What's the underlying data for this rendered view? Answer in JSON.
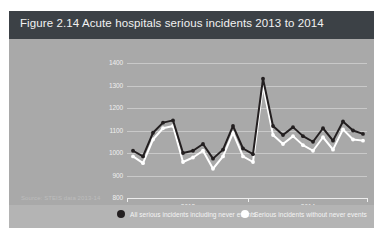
{
  "figure": {
    "title": "Figure 2.14  Acute hospitals serious incidents 2013 to 2014",
    "source_note": "Source: STEIS data 2013-14"
  },
  "colors": {
    "panel_background": "#a9a9a9",
    "header_background": "#3c4146",
    "legend_background": "#b4b4b4",
    "series_dark": "#231f20",
    "series_light": "#ffffff",
    "gridline": "#cfcfcf",
    "axis": "#ededed",
    "title_text": "#f2f2f2",
    "label_text": "#efefef",
    "source_text": "#bdbdbd"
  },
  "legend": {
    "entries": [
      {
        "label": "All serious incidents including never events",
        "marker": "filled-circle",
        "color": "#231f20"
      },
      {
        "label": "Serious incidents without never events",
        "marker": "open-circle",
        "color": "#ffffff"
      }
    ]
  },
  "chart_data": {
    "type": "line",
    "title": "Figure 2.14  Acute hospitals serious incidents 2013 to 2014",
    "xlabel": "",
    "ylabel": "",
    "ylim": [
      800,
      1400
    ],
    "yticks": [
      1400,
      1300,
      1200,
      1100,
      1000,
      900,
      800
    ],
    "ytick_labels": [
      "1400",
      "1300",
      "1200",
      "1100",
      "1000",
      "900",
      "800"
    ],
    "grid": true,
    "legend_position": "bottom",
    "x_axis_groups": [
      {
        "label": "2013",
        "start_index": 0,
        "end_index": 11
      },
      {
        "label": "2014",
        "start_index": 12,
        "end_index": 23
      }
    ],
    "x_tick_labels": [
      "2013",
      "2014"
    ],
    "x": [
      1,
      2,
      3,
      4,
      5,
      6,
      7,
      8,
      9,
      10,
      11,
      12,
      13,
      14,
      15,
      16,
      17,
      18,
      19,
      20,
      21,
      22,
      23,
      24
    ],
    "series": [
      {
        "name": "All serious incidents including never events",
        "color": "#231f20",
        "marker": "filled-circle",
        "values": [
          1010,
          985,
          1090,
          1135,
          1145,
          1000,
          1010,
          1040,
          975,
          1015,
          1120,
          1020,
          995,
          1330,
          1120,
          1080,
          1115,
          1075,
          1050,
          1110,
          1055,
          1140,
          1100,
          1085
        ]
      },
      {
        "name": "Serious incidents without never events",
        "color": "#ffffff",
        "marker": "open-circle",
        "values": [
          985,
          955,
          1060,
          1110,
          1120,
          960,
          980,
          1010,
          930,
          985,
          1090,
          985,
          960,
          1300,
          1080,
          1040,
          1075,
          1035,
          1010,
          1070,
          1015,
          1105,
          1060,
          1055
        ]
      }
    ]
  }
}
